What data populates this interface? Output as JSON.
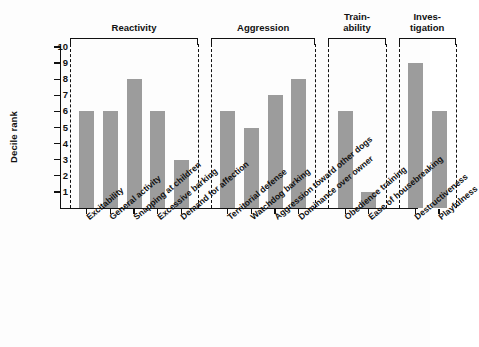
{
  "chart_data": {
    "type": "bar",
    "title": "",
    "xlabel": "",
    "ylabel": "Decile rank",
    "ylim": [
      0,
      10
    ],
    "yticks": [
      10,
      9,
      8,
      7,
      6,
      5,
      4,
      3,
      2,
      1
    ],
    "grid": false,
    "legend": "none",
    "bar_color": "#9c9c9c",
    "axis_color": "#111111",
    "categories": [
      "Excitability",
      "General activity",
      "Snapping at children",
      "Excessive barking",
      "Demand for affection",
      "Territorial defense",
      "Watchdog barking",
      "Aggression toward other dogs",
      "Dominance over owner",
      "Obedience training",
      "Ease of housebreaking",
      "Destructiveness",
      "Playfulness"
    ],
    "values": [
      6,
      6,
      8,
      6,
      3,
      6,
      5,
      7,
      8,
      6,
      1,
      9,
      6
    ],
    "groups": [
      {
        "label": "Reactivity",
        "label_lines": "Reactivity",
        "categories": [
          "Excitability",
          "General activity",
          "Snapping at children",
          "Excessive barking",
          "Demand for affection"
        ],
        "values": [
          6,
          6,
          8,
          6,
          3
        ]
      },
      {
        "label": "Aggression",
        "label_lines": "Aggression",
        "categories": [
          "Territorial defense",
          "Watchdog barking",
          "Aggression toward other dogs",
          "Dominance over owner"
        ],
        "values": [
          6,
          5,
          7,
          8
        ]
      },
      {
        "label": "Train-ability",
        "label_lines": "Train-\nability",
        "categories": [
          "Obedience training",
          "Ease of housebreaking"
        ],
        "values": [
          6,
          1
        ]
      },
      {
        "label": "Investigation",
        "label_lines": "Inves-\ntigation",
        "categories": [
          "Destructiveness",
          "Playfulness"
        ],
        "values": [
          9,
          6
        ]
      }
    ]
  }
}
